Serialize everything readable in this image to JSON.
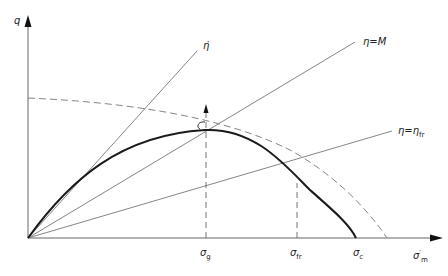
{
  "diagram": {
    "axes": {
      "y_label": "q",
      "x_label": "σ",
      "x_label_prime": "′",
      "x_label_sub": "m"
    },
    "lines": [
      {
        "name": "eta-dot",
        "label": "η̇"
      },
      {
        "name": "eta-M",
        "label": "η=M"
      },
      {
        "name": "eta-fr",
        "label": "η=η",
        "label_sub": "fr"
      }
    ],
    "x_ticks": [
      {
        "label": "σ",
        "sub": "g"
      },
      {
        "label": "σ",
        "sub": "fr"
      },
      {
        "label": "σ",
        "sub": "c"
      }
    ],
    "curves": [
      {
        "name": "yield-locus",
        "style": "solid"
      },
      {
        "name": "reference-ellipse",
        "style": "dashed"
      }
    ],
    "colors": {
      "line": "#555555",
      "curve": "#1a1a1a",
      "background": "#ffffff"
    }
  }
}
